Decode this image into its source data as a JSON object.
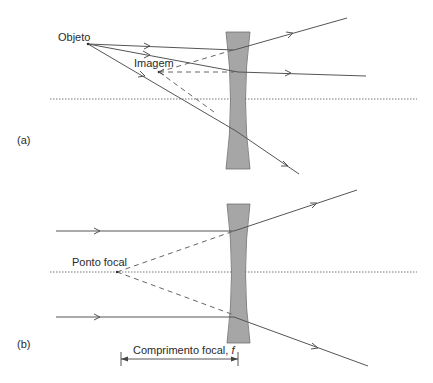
{
  "figure": {
    "panel_a": {
      "label": "(a)",
      "object_label": "Objeto",
      "image_label": "Imagem"
    },
    "panel_b": {
      "label": "(b)",
      "focal_point_label": "Ponto focal",
      "focal_length_label": "Comprimento focal, ",
      "focal_length_symbol": "f"
    },
    "colors": {
      "lens_fill": "#a6a6a6",
      "ray": "#555555",
      "axis": "#777777"
    }
  }
}
